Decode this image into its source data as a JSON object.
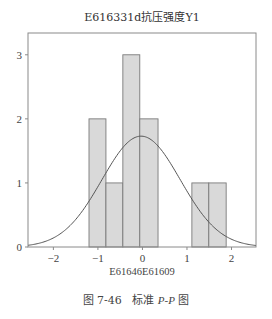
{
  "chart_data": {
    "type": "bar",
    "subtype": "histogram-with-normal-curve",
    "title": "E616331d抗压强度Y1",
    "xlabel": "E61646E61609",
    "ylabel": "",
    "xlim": [
      -2.57,
      2.55
    ],
    "ylim": [
      0,
      3.34
    ],
    "xticks": [
      -2,
      -1,
      0,
      1,
      2
    ],
    "xtick_labels": [
      "−2",
      "−1",
      "0",
      "1",
      "2"
    ],
    "yticks": [
      0,
      1,
      2,
      3
    ],
    "ytick_labels": [
      "0",
      "1",
      "2",
      "3"
    ],
    "grid": false,
    "bins": [
      {
        "x0": -1.2,
        "x1": -0.82,
        "count": 2
      },
      {
        "x0": -0.82,
        "x1": -0.44,
        "count": 1
      },
      {
        "x0": -0.44,
        "x1": -0.06,
        "count": 3
      },
      {
        "x0": -0.06,
        "x1": 0.35,
        "count": 2
      },
      {
        "x0": 1.11,
        "x1": 1.49,
        "count": 1
      },
      {
        "x0": 1.49,
        "x1": 1.88,
        "count": 1
      }
    ],
    "normal_curve": {
      "mean": -0.03,
      "sd": 0.88,
      "peak": 1.73
    },
    "colors": {
      "bar_fill": "#d9d9d9",
      "bar_stroke": "#7a7a7a",
      "curve": "#555555",
      "axis": "#8a8a8a"
    }
  },
  "caption": {
    "prefix": "图 7-46",
    "text_before": "标准 ",
    "italic": "P-P",
    "text_after": " 图"
  }
}
